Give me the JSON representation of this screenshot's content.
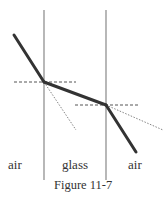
{
  "figure": {
    "caption": "Figure 11-7",
    "regions": [
      {
        "label": "air"
      },
      {
        "label": "glass"
      },
      {
        "label": "air"
      }
    ],
    "colors": {
      "boundary": "#888888",
      "ray": "#333333",
      "normal": "#555555",
      "extension": "#777777",
      "text": "#333333"
    }
  }
}
